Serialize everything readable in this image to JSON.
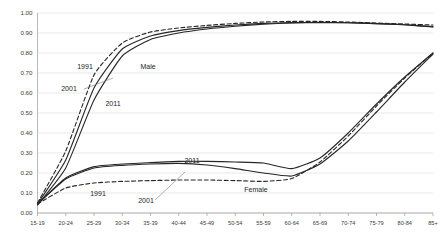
{
  "chart_data": {
    "type": "line",
    "title": "",
    "subtitle": "",
    "xlabel": "",
    "ylabel": "",
    "grid": true,
    "legend_position": "inline-annotations",
    "ylim": [
      0.0,
      1.0
    ],
    "ytick_labels": [
      "0.00",
      "0.10",
      "0.20",
      "0.30",
      "0.40",
      "0.50",
      "0.60",
      "0.70",
      "0.80",
      "0.90",
      "1.00"
    ],
    "ytick_values": [
      0.0,
      0.1,
      0.2,
      0.3,
      0.4,
      0.5,
      0.6,
      0.7,
      0.8,
      0.9,
      1.0
    ],
    "categories": [
      "15-19",
      "20-24",
      "25-29",
      "30-34",
      "35-39",
      "40-44",
      "45-49",
      "50-54",
      "55-59",
      "60-64",
      "65-69",
      "70-74",
      "75-79",
      "80-84",
      "85+"
    ],
    "series": [
      {
        "name": "Male 1991",
        "group": "Male",
        "year": "1991",
        "style": "dashed",
        "values": [
          0.05,
          0.31,
          0.69,
          0.85,
          0.905,
          0.925,
          0.938,
          0.948,
          0.955,
          0.958,
          0.958,
          0.955,
          0.95,
          0.945,
          0.94
        ]
      },
      {
        "name": "Male 2001",
        "group": "Male",
        "year": "2001",
        "style": "solid",
        "values": [
          0.045,
          0.265,
          0.625,
          0.82,
          0.885,
          0.912,
          0.928,
          0.94,
          0.948,
          0.952,
          0.953,
          0.951,
          0.947,
          0.941,
          0.932
        ]
      },
      {
        "name": "Male 2011",
        "group": "Male",
        "year": "2011",
        "style": "solid",
        "values": [
          0.04,
          0.225,
          0.565,
          0.785,
          0.868,
          0.9,
          0.92,
          0.934,
          0.944,
          0.95,
          0.952,
          0.951,
          0.947,
          0.941,
          0.93
        ]
      },
      {
        "name": "Female 1991",
        "group": "Female",
        "year": "1991",
        "style": "dashed",
        "values": [
          0.045,
          0.125,
          0.15,
          0.158,
          0.162,
          0.165,
          0.165,
          0.162,
          0.158,
          0.172,
          0.255,
          0.385,
          0.535,
          0.675,
          0.8
        ]
      },
      {
        "name": "Female 2001",
        "group": "Female",
        "year": "2001",
        "style": "solid",
        "values": [
          0.045,
          0.17,
          0.225,
          0.238,
          0.245,
          0.248,
          0.24,
          0.222,
          0.2,
          0.185,
          0.245,
          0.36,
          0.505,
          0.655,
          0.795
        ]
      },
      {
        "name": "Female 2011",
        "group": "Female",
        "year": "2011",
        "style": "solid",
        "values": [
          0.045,
          0.175,
          0.232,
          0.245,
          0.252,
          0.258,
          0.258,
          0.255,
          0.25,
          0.222,
          0.275,
          0.4,
          0.545,
          0.68,
          0.8
        ]
      }
    ],
    "annotations": [
      {
        "id": "male-1991",
        "text": "1991",
        "x_px": 85,
        "y_px": 69
      },
      {
        "id": "male-group",
        "text": "Male",
        "x_px": 148,
        "y_px": 69
      },
      {
        "id": "male-2001",
        "text": "2001",
        "x_px": 69,
        "y_px": 91
      },
      {
        "id": "male-2011",
        "text": "2011",
        "x_px": 113,
        "y_px": 106
      },
      {
        "id": "female-2011",
        "text": "2011",
        "x_px": 192,
        "y_px": 163
      },
      {
        "id": "female-1991",
        "text": "1991",
        "x_px": 98,
        "y_px": 196
      },
      {
        "id": "female-2001",
        "text": "2001",
        "x_px": 146,
        "y_px": 203
      },
      {
        "id": "female-group",
        "text": "Female",
        "x_px": 256,
        "y_px": 192
      }
    ]
  },
  "colors": {
    "line": "#262626",
    "grid": "#d9d9d9",
    "axis": "#9a9a9a",
    "text": "#3a3a3a",
    "background": "#ffffff"
  }
}
